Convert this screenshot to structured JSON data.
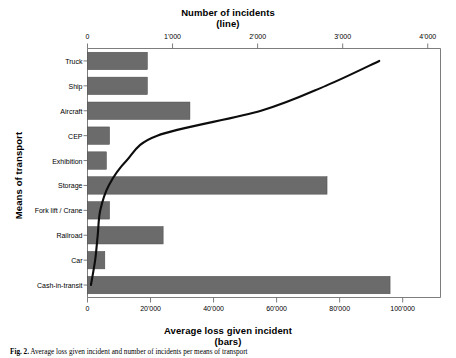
{
  "chart_data": {
    "type": "bar",
    "title": "",
    "categories": [
      "Truck",
      "Ship",
      "Aircraft",
      "CEP",
      "Exhibition",
      "Storage",
      "Fork lift / Crane",
      "Railroad",
      "Car",
      "Cash-in-transit"
    ],
    "series": [
      {
        "name": "Average loss given incident (bars)",
        "type": "bar",
        "axis": "bottom",
        "values": [
          19000,
          19000,
          32500,
          7000,
          6000,
          76000,
          7000,
          24000,
          5500,
          96000
        ]
      },
      {
        "name": "Number of incidents (line)",
        "type": "line",
        "axis": "top",
        "values": [
          3430,
          2800,
          2040,
          820,
          460,
          250,
          150,
          120,
          90,
          40
        ]
      }
    ],
    "top_axis": {
      "label": "Number of incidents",
      "sublabel": "(line)",
      "ticks": [
        "0",
        "1'000",
        "2'000",
        "3'000",
        "4'000"
      ],
      "tick_values": [
        0,
        1000,
        2000,
        3000,
        4000
      ],
      "range": [
        0,
        4150
      ]
    },
    "bottom_axis": {
      "label": "Average loss given incident",
      "sublabel": "(bars)",
      "ticks": [
        "0",
        "20'000",
        "40'000",
        "60'000",
        "80'000",
        "100'000"
      ],
      "tick_values": [
        0,
        20000,
        40000,
        60000,
        80000,
        100000
      ],
      "range": [
        0,
        112000
      ]
    },
    "ylabel": "Means of transport",
    "grid": false,
    "legend_position": "none",
    "colors": {
      "bar_fill": "#6b6b6b",
      "line": "#0d0d0d",
      "axis": "#6e6e6e",
      "text": "#000000"
    }
  },
  "top_axis_title_line1": "Number of incidents",
  "top_axis_title_line2": "(line)",
  "bottom_axis_title_line1": "Average loss given incident",
  "bottom_axis_title_line2": "(bars)",
  "y_axis_title": "Means of transport",
  "caption": {
    "label": "Fig. 2.",
    "text": " Average loss given incident and number of incidents per means of transport"
  }
}
